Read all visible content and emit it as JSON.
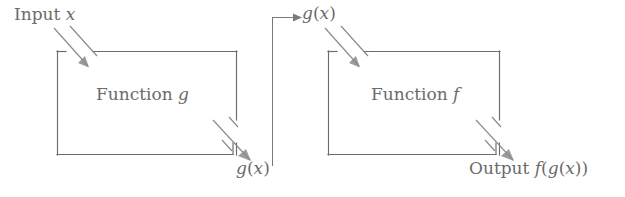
{
  "diagram": {
    "background_color": "#ffffff",
    "line_color": "#6b6b6b",
    "text_color": "#6b6b6b",
    "labels": {
      "input": {
        "prefix": "Input ",
        "variable": "x"
      },
      "box_g": {
        "prefix": "Function ",
        "variable": "g"
      },
      "g_of_x_bottom": {
        "fn": "g",
        "open": "(",
        "arg": "x",
        "close": ")"
      },
      "g_of_x_top": {
        "fn": "g",
        "open": "(",
        "arg": "x",
        "close": ")"
      },
      "box_f": {
        "prefix": "Function ",
        "variable": "f"
      },
      "output": {
        "prefix": "Output ",
        "outer_fn": "f",
        "open1": "(",
        "inner_fn": "g",
        "open2": "(",
        "arg": "x",
        "close2": ")",
        "close1": ")"
      }
    },
    "boxes": [
      {
        "name": "function-g",
        "x": 57,
        "y": 51,
        "width": 180,
        "height": 104,
        "label": "Function g"
      },
      {
        "name": "function-f",
        "x": 328,
        "y": 51,
        "width": 172,
        "height": 104,
        "label": "Function f"
      }
    ],
    "connector": {
      "name": "g-of-x-feed",
      "from_x": 272,
      "from_y": 165,
      "corner_x": 272,
      "corner_y": 17,
      "to_x": 298,
      "to_y": 17,
      "arrowhead": "right"
    },
    "flow_arrows": [
      {
        "name": "input-into-g",
        "direction": "down-right",
        "target": "function-g"
      },
      {
        "name": "g-out",
        "direction": "down-right",
        "source": "function-g"
      },
      {
        "name": "gx-into-f",
        "direction": "down-right",
        "target": "function-f"
      },
      {
        "name": "f-out",
        "direction": "down-right",
        "source": "function-f"
      }
    ]
  }
}
